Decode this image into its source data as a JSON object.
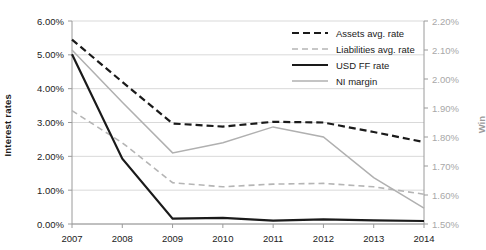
{
  "chart_data": {
    "type": "line",
    "title": "",
    "xlabel": "",
    "ylabel": "Interest rates",
    "y2label": "Win",
    "categories": [
      "2007",
      "2008",
      "2009",
      "2010",
      "2011",
      "2012",
      "2013",
      "2014"
    ],
    "x": [
      2007,
      2008,
      2009,
      2010,
      2011,
      2012,
      2013,
      2014
    ],
    "ylim": [
      0.0,
      6.0
    ],
    "y2lim": [
      1.5,
      2.2
    ],
    "yticks": [
      "0.00%",
      "1.00%",
      "2.00%",
      "3.00%",
      "4.00%",
      "5.00%",
      "6.00%"
    ],
    "ytick_values": [
      0.0,
      1.0,
      2.0,
      3.0,
      4.0,
      5.0,
      6.0
    ],
    "y2ticks": [
      "1.50%",
      "1.60%",
      "1.70%",
      "1.80%",
      "1.90%",
      "2.00%",
      "2.10%",
      "2.20%"
    ],
    "y2tick_values": [
      1.5,
      1.6,
      1.7,
      1.8,
      1.9,
      2.0,
      2.1,
      2.2
    ],
    "grid": true,
    "legend_position": "top-right",
    "series": [
      {
        "name": "Assets avg. rate",
        "axis": "left",
        "style": "dashed",
        "color": "#1a1a1a",
        "values": [
          5.45,
          4.2,
          2.97,
          2.88,
          3.02,
          3.0,
          2.72,
          2.42
        ]
      },
      {
        "name": "Liabilities avg. rate",
        "axis": "left",
        "style": "dashed",
        "color": "#b5b5b5",
        "values": [
          3.35,
          2.4,
          1.22,
          1.1,
          1.18,
          1.2,
          1.1,
          0.88
        ]
      },
      {
        "name": "USD FF rate",
        "axis": "left",
        "style": "solid",
        "color": "#1a1a1a",
        "values": [
          5.02,
          1.93,
          0.16,
          0.18,
          0.1,
          0.14,
          0.11,
          0.09
        ]
      },
      {
        "name": "NI margin",
        "axis": "right",
        "style": "solid",
        "color": "#b0b0b0",
        "values": [
          2.1,
          1.92,
          1.745,
          1.78,
          1.835,
          1.8,
          1.66,
          1.555
        ]
      }
    ]
  },
  "legend": {
    "items": [
      {
        "label": "Assets avg. rate"
      },
      {
        "label": "Liabilities avg. rate"
      },
      {
        "label": "USD FF rate"
      },
      {
        "label": "NI margin"
      }
    ]
  }
}
